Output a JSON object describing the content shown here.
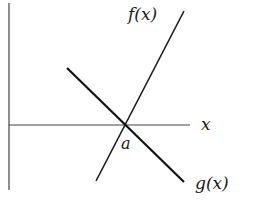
{
  "diagram": {
    "labels": {
      "f": "f(x)",
      "g": "g(x)",
      "x_axis": "x",
      "intersection": "a"
    },
    "colors": {
      "line": "#1a1a1a",
      "axis": "#333333",
      "background": "#ffffff"
    }
  }
}
